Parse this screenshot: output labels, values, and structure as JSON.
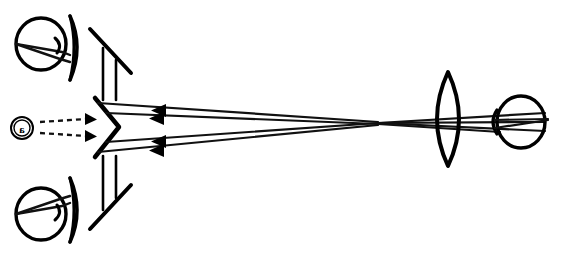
{
  "figure": {
    "background_color": "#ffffff",
    "ink_color": "#000000",
    "width": 561,
    "height": 257
  },
  "object": {
    "label": "a",
    "label_orientation": "mirror-reversed",
    "symbol": "circled-letter",
    "center_x": 22,
    "center_y": 128,
    "radius": 11
  },
  "illumination_arrows": [
    {
      "name": "upper-illumination-arrow",
      "x1": 40,
      "y1": 122,
      "x2": 94,
      "y2": 119
    },
    {
      "name": "lower-illumination-arrow",
      "x1": 40,
      "y1": 133,
      "x2": 94,
      "y2": 136
    }
  ],
  "components": {
    "beamsplitter_prism": {
      "name": "v-shaped-mirror-prism",
      "vertex_x": 118,
      "vertex_y": 127,
      "top_x": 96,
      "top_y": 99,
      "bottom_x": 96,
      "bottom_y": 157
    },
    "top_fold_mirror": {
      "name": "top-fold-mirror",
      "x1": 91,
      "y1": 30,
      "x2": 130,
      "y2": 72
    },
    "bottom_fold_mirror": {
      "name": "bottom-fold-mirror",
      "x1": 91,
      "y1": 228,
      "x2": 130,
      "y2": 186
    },
    "top_eyepiece_lens": {
      "name": "top-eyepiece-lens",
      "cx": 76,
      "cy": 47,
      "half_height": 33,
      "bulge": 7
    },
    "bottom_eyepiece_lens": {
      "name": "bottom-eyepiece-lens",
      "cx": 76,
      "cy": 211,
      "half_height": 33,
      "bulge": 7
    },
    "objective_lens": {
      "name": "objective-biconvex-lens",
      "cx": 448,
      "cy": 119,
      "half_height": 47,
      "bulge": 21
    }
  },
  "eyes": [
    {
      "name": "eye-top-left",
      "cx": 41,
      "cy": 44,
      "rx": 25,
      "ry": 26
    },
    {
      "name": "eye-bottom-left",
      "cx": 41,
      "cy": 214,
      "rx": 25,
      "ry": 26
    },
    {
      "name": "eye-right",
      "cx": 521,
      "cy": 122,
      "rx": 24,
      "ry": 26
    }
  ],
  "ray_bundles": {
    "upper_channel_label": "upper-ray-bundle",
    "lower_channel_label": "lower-ray-bundle",
    "crossover_x": 378,
    "crossover_y": 123,
    "arrowheads": [
      {
        "name": "ray-arrowhead-upper-1",
        "x": 160,
        "y": 110,
        "direction": "left"
      },
      {
        "name": "ray-arrowhead-upper-2",
        "x": 158,
        "y": 118,
        "direction": "left"
      },
      {
        "name": "ray-arrowhead-lower-1",
        "x": 160,
        "y": 141,
        "direction": "left"
      },
      {
        "name": "ray-arrowhead-lower-2",
        "x": 158,
        "y": 150,
        "direction": "left"
      }
    ]
  }
}
